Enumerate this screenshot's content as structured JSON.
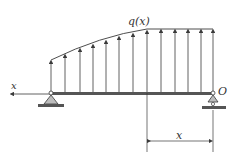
{
  "diagram": {
    "type": "simply-supported-beam",
    "load_label": "q(x)",
    "axis_label": "x",
    "origin_label": "O",
    "dimension_label": "x",
    "colors": {
      "line": "#3a3a3a",
      "beam": "#555555",
      "support_fill": "#bdbdbd",
      "background": "#ffffff"
    },
    "beam": {
      "x_start": 51,
      "x_end": 213,
      "y": 93
    },
    "load_arrows_x": [
      51,
      65,
      80,
      93,
      106,
      119,
      133,
      147,
      161,
      175,
      188,
      201,
      213
    ],
    "supports": [
      {
        "type": "pin",
        "x": 51
      },
      {
        "type": "roller",
        "x": 213
      }
    ]
  }
}
